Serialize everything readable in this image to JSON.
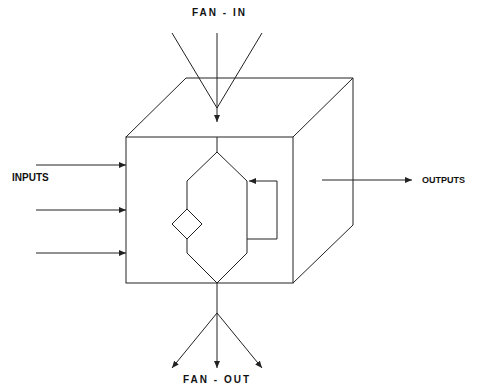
{
  "diagram": {
    "labels": {
      "fan_in": "FAN - IN",
      "fan_out": "FAN - OUT",
      "outputs": "OUTPUTS",
      "inputs": "INPUTS"
    },
    "colors": {
      "line": "#222222",
      "background": "#ffffff"
    },
    "inputs_count": 3,
    "fan_in_lines": 3,
    "fan_out_arrows": 3
  }
}
